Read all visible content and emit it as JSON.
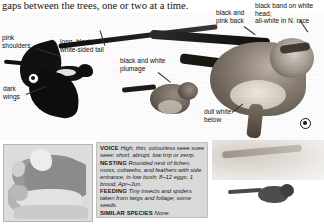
{
  "page": {
    "running_text": "gaps between the trees, one or two at a time."
  },
  "callouts": [
    {
      "id": "pink-shoulders",
      "text": "pink\nshoulders"
    },
    {
      "id": "long-black-white-sided-tail",
      "text": "long, black,\nwhite-sided tail"
    },
    {
      "id": "dark-wings",
      "text": "dark\nwings"
    },
    {
      "id": "black-and-white-plumage",
      "text": "black and white\nplumage"
    },
    {
      "id": "black-and-pink-back",
      "text": "black and\npink back"
    },
    {
      "id": "black-band-on-white-head",
      "text": "black band on white head;\nall-white in N. race"
    },
    {
      "id": "dull-white-below",
      "text": "dull white\nbelow"
    }
  ],
  "map": {
    "label": "range-map-europe"
  },
  "info_panel": {
    "entries": [
      {
        "key": "VOICE",
        "value": "High, thin, colourless seee soee seee; short, abrupt, low trrp or zerrp."
      },
      {
        "key": "NESTING",
        "value": "Rounded nest of lichen, moss, cobwebs, and feathers with side entrance, in low bush; 8–12 eggs; 1 brood, Apr–Jun."
      },
      {
        "key": "FEEDING",
        "value": "Tiny insects and spiders taken from twigs and foliage; some seeds."
      },
      {
        "key": "SIMILAR SPECIES",
        "value": "None."
      }
    ]
  },
  "colors": {
    "panel_bg": "#d9d9d9",
    "panel_border": "#bdbdbd",
    "map_bg": "#e7e7e7",
    "text": "#161616"
  }
}
